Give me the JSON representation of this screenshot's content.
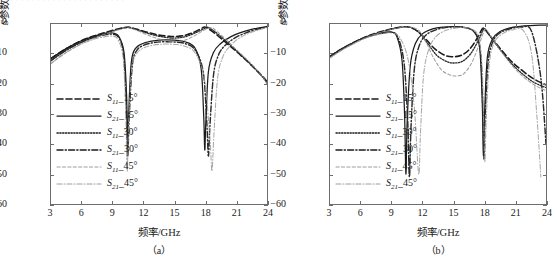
{
  "figure": {
    "scan_artifact_top": "· · ·   · · · · · ·        · ·  ·  · · · · · · ·  · · · ·  ·"
  },
  "panels": [
    {
      "id": "a",
      "caption": "（a）",
      "xlabel": "频率/GHz",
      "ylabel_prefix": "S",
      "ylabel_suffix": "参数/dB",
      "xticks": [
        "3",
        "6",
        "9",
        "12",
        "15",
        "18",
        "21",
        "24"
      ],
      "yticks": [
        "0",
        "−10",
        "−20",
        "−30",
        "−40",
        "−50",
        "−60"
      ],
      "legend": [
        {
          "sym": "S",
          "sub": "11",
          "ang": "_15°",
          "style": "dashed"
        },
        {
          "sym": "S",
          "sub": "21",
          "ang": "_15°",
          "style": "solid"
        },
        {
          "sym": "S",
          "sub": "11",
          "ang": "_30°",
          "style": "dotted"
        },
        {
          "sym": "S",
          "sub": "21",
          "ang": "_30°",
          "style": "dashdot"
        },
        {
          "sym": "S",
          "sub": "11",
          "ang": "_45°",
          "style": "dashed-light"
        },
        {
          "sym": "S",
          "sub": "21",
          "ang": "_45°",
          "style": "dashdot-light"
        }
      ]
    },
    {
      "id": "b",
      "caption": "（b）",
      "xlabel": "频率/GHz",
      "ylabel_prefix": "S",
      "ylabel_suffix": "参数/dB",
      "xticks": [
        "3",
        "6",
        "9",
        "12",
        "15",
        "18",
        "21",
        "24"
      ],
      "yticks": [
        "0",
        "−10",
        "−20",
        "−30",
        "−40",
        "−50",
        "−60"
      ],
      "legend": [
        {
          "sym": "S",
          "sub": "11",
          "ang": "_15°",
          "style": "dashed"
        },
        {
          "sym": "S",
          "sub": "21",
          "ang": "_15°",
          "style": "solid"
        },
        {
          "sym": "S",
          "sub": "11",
          "ang": "_30°",
          "style": "dotted"
        },
        {
          "sym": "S",
          "sub": "21",
          "ang": "_30°",
          "style": "dashdot"
        },
        {
          "sym": "S",
          "sub": "11",
          "ang": "_45°",
          "style": "dashed-light"
        },
        {
          "sym": "S",
          "sub": "21",
          "ang": "_45°",
          "style": "dashdot-light"
        }
      ]
    }
  ],
  "chart_data": [
    {
      "type": "line",
      "panel": "a",
      "title": "",
      "xlabel": "频率/GHz",
      "ylabel": "S参数/dB",
      "xlim": [
        3,
        24
      ],
      "ylim": [
        -60,
        0
      ],
      "xticks": [
        3,
        6,
        9,
        12,
        15,
        18,
        21,
        24
      ],
      "yticks": [
        0,
        -10,
        -20,
        -30,
        -40,
        -50,
        -60
      ],
      "grid": false,
      "legend_position": "left-lower",
      "series": [
        {
          "name": "S11_15°",
          "style": "dashed",
          "color": "#1a1a1a",
          "x": [
            3,
            4,
            5,
            6,
            7,
            8,
            9,
            9.6,
            10.1,
            10.4,
            10.5,
            10.6,
            11,
            11.6,
            12.5,
            13.5,
            14.5,
            15,
            16,
            17,
            17.5,
            17.85,
            17.95,
            18.1,
            18.5,
            19,
            19.6,
            20.5,
            21.5,
            22.5,
            23.5,
            24
          ],
          "y": [
            -11.5,
            -9.2,
            -7.2,
            -5.5,
            -4.2,
            -3.1,
            -2.1,
            -1.6,
            -1.2,
            -1.1,
            -1.05,
            -1.1,
            -1.4,
            -2.0,
            -2.9,
            -3.7,
            -4.1,
            -4.2,
            -3.8,
            -2.6,
            -1.7,
            -1.1,
            -1.0,
            -1.2,
            -2.0,
            -3.3,
            -5.0,
            -7.6,
            -10.6,
            -13.8,
            -17.2,
            -19.2
          ]
        },
        {
          "name": "S21_15°",
          "style": "solid",
          "color": "#1a1a1a",
          "x": [
            3,
            4,
            5,
            6,
            7,
            8,
            9,
            9.6,
            10.1,
            10.35,
            10.45,
            10.55,
            10.8,
            11.2,
            12,
            13,
            14,
            15,
            16,
            17,
            17.6,
            17.85,
            17.95,
            18.05,
            18.3,
            18.8,
            19.5,
            20.5,
            21.5,
            22.5,
            23.5,
            24
          ],
          "y": [
            -11.5,
            -9.2,
            -7.2,
            -5.5,
            -4.3,
            -3.4,
            -3.0,
            -4.2,
            -9.5,
            -24,
            -41,
            -30,
            -13,
            -8.2,
            -6.4,
            -5.6,
            -5.3,
            -5.4,
            -5.9,
            -8.0,
            -15,
            -31,
            -42,
            -33,
            -16,
            -9.5,
            -6.5,
            -4.2,
            -2.8,
            -1.8,
            -1.1,
            -0.8
          ]
        },
        {
          "name": "S11_30°",
          "style": "dotted",
          "color": "#2a2a2a",
          "x": [
            3,
            4,
            5,
            6,
            7,
            8,
            9,
            9.6,
            10.1,
            10.4,
            10.5,
            10.6,
            11,
            11.6,
            12.5,
            13.5,
            14.5,
            15,
            16,
            17,
            17.8,
            18.1,
            18.25,
            18.4,
            18.8,
            19.3,
            19.9,
            20.8,
            21.8,
            22.8,
            23.6,
            24
          ],
          "y": [
            -12.2,
            -9.8,
            -7.7,
            -6.0,
            -4.6,
            -3.4,
            -2.3,
            -1.7,
            -1.3,
            -1.15,
            -1.1,
            -1.15,
            -1.5,
            -2.2,
            -3.2,
            -4.1,
            -4.6,
            -4.7,
            -4.3,
            -3.0,
            -1.7,
            -1.2,
            -1.1,
            -1.3,
            -2.2,
            -3.6,
            -5.4,
            -8.2,
            -11.4,
            -14.8,
            -17.8,
            -19.7
          ]
        },
        {
          "name": "S21_30°",
          "style": "dashdot",
          "color": "#2a2a2a",
          "x": [
            3,
            4,
            5,
            6,
            7,
            8,
            9,
            9.6,
            10.05,
            10.3,
            10.45,
            10.6,
            10.9,
            11.3,
            12,
            13,
            14,
            15,
            16,
            17,
            17.8,
            18.15,
            18.3,
            18.45,
            18.8,
            19.3,
            20,
            21,
            22,
            23,
            23.6,
            24
          ],
          "y": [
            -12.2,
            -9.8,
            -7.7,
            -6.0,
            -4.7,
            -3.8,
            -3.4,
            -4.6,
            -10,
            -25,
            -44,
            -31,
            -14,
            -9.0,
            -7.1,
            -6.2,
            -5.9,
            -6.0,
            -6.5,
            -8.6,
            -16,
            -33,
            -44,
            -34,
            -17,
            -10.2,
            -6.9,
            -4.4,
            -2.9,
            -1.8,
            -1.3,
            -1.0
          ]
        },
        {
          "name": "S11_45°",
          "style": "dashed-light",
          "color": "#8e8e8e",
          "x": [
            3,
            4,
            5,
            6,
            7,
            8,
            9,
            9.6,
            10.1,
            10.4,
            10.5,
            10.6,
            11,
            11.6,
            12.5,
            13.5,
            14.5,
            15,
            16,
            17,
            17.9,
            18.4,
            18.6,
            18.75,
            19.1,
            19.6,
            20.2,
            21.1,
            22.1,
            23.1,
            23.8,
            24
          ],
          "y": [
            -13.2,
            -10.6,
            -8.4,
            -6.5,
            -5.0,
            -3.7,
            -2.5,
            -1.9,
            -1.45,
            -1.3,
            -1.25,
            -1.3,
            -1.7,
            -2.5,
            -3.8,
            -5.0,
            -5.7,
            -5.9,
            -5.4,
            -3.8,
            -2.0,
            -1.3,
            -1.2,
            -1.4,
            -2.4,
            -3.9,
            -5.8,
            -8.8,
            -12.0,
            -15.6,
            -18.6,
            -20.2
          ]
        },
        {
          "name": "S21_45°",
          "style": "dashdot-light",
          "color": "#9a9a9a",
          "x": [
            3,
            4,
            5,
            6,
            7,
            8,
            9,
            9.5,
            10,
            10.25,
            10.4,
            10.55,
            10.85,
            11.3,
            12,
            13,
            14,
            15,
            16,
            17,
            17.9,
            18.45,
            18.65,
            18.85,
            19.2,
            19.7,
            20.4,
            21.3,
            22.3,
            23.3,
            23.8,
            24
          ],
          "y": [
            -13.2,
            -10.6,
            -8.4,
            -6.6,
            -5.3,
            -4.4,
            -4.0,
            -5.2,
            -11,
            -27,
            -49,
            -33,
            -15,
            -10.0,
            -8.0,
            -7.0,
            -6.7,
            -6.8,
            -7.4,
            -9.6,
            -18,
            -38,
            -49,
            -36,
            -18,
            -11.0,
            -7.4,
            -4.7,
            -3.0,
            -1.9,
            -1.4,
            -1.2
          ]
        }
      ]
    },
    {
      "type": "line",
      "panel": "b",
      "title": "",
      "xlabel": "频率/GHz",
      "ylabel": "S参数/dB",
      "xlim": [
        3,
        24
      ],
      "ylim": [
        -60,
        0
      ],
      "xticks": [
        3,
        6,
        9,
        12,
        15,
        18,
        21,
        24
      ],
      "yticks": [
        0,
        -10,
        -20,
        -30,
        -40,
        -50,
        -60
      ],
      "grid": false,
      "legend_position": "left-lower",
      "series": [
        {
          "name": "S11_15°",
          "style": "dashed",
          "color": "#1a1a1a",
          "x": [
            3,
            4,
            5,
            6,
            7,
            8,
            9,
            9.6,
            10.05,
            10.3,
            10.42,
            10.55,
            10.9,
            11.5,
            12.3,
            13.2,
            14.2,
            15,
            15.8,
            16.6,
            17.3,
            17.75,
            17.88,
            18.02,
            18.3,
            18.8,
            19.5,
            20.5,
            21.5,
            22.5,
            23.3,
            24
          ],
          "y": [
            -10.8,
            -8.6,
            -6.7,
            -5.0,
            -3.6,
            -2.5,
            -1.6,
            -1.2,
            -0.95,
            -0.9,
            -0.9,
            -0.95,
            -1.3,
            -2.4,
            -5.0,
            -8.3,
            -10.5,
            -10.9,
            -10.4,
            -8.3,
            -4.8,
            -1.9,
            -1.4,
            -1.6,
            -2.8,
            -5.0,
            -8.0,
            -12.0,
            -15.0,
            -17.6,
            -19.2,
            -20.3
          ]
        },
        {
          "name": "S21_15°",
          "style": "solid",
          "color": "#1a1a1a",
          "x": [
            3,
            4,
            5,
            6,
            7,
            8,
            9,
            9.5,
            10,
            10.25,
            10.38,
            10.5,
            10.8,
            11.3,
            12,
            13,
            14,
            15,
            16,
            17,
            17.55,
            17.8,
            17.92,
            18.05,
            18.3,
            18.8,
            19.5,
            20.5,
            21.5,
            22.5,
            23.5,
            24
          ],
          "y": [
            -10.8,
            -8.6,
            -6.7,
            -5.0,
            -3.8,
            -3.0,
            -2.7,
            -4.2,
            -12,
            -30,
            -50,
            -33,
            -14,
            -6.5,
            -3.2,
            -1.6,
            -1.0,
            -0.85,
            -1.1,
            -2.6,
            -8.0,
            -26,
            -44,
            -28,
            -11,
            -5.0,
            -2.6,
            -1.3,
            -0.8,
            -0.55,
            -0.4,
            -0.35
          ]
        },
        {
          "name": "S11_30°",
          "style": "dotted",
          "color": "#2a2a2a",
          "x": [
            3,
            4,
            5,
            6,
            7,
            8,
            9,
            9.6,
            10.1,
            10.4,
            10.55,
            10.7,
            11.1,
            11.7,
            12.5,
            13.4,
            14.4,
            15.1,
            15.9,
            16.7,
            17.4,
            17.85,
            17.98,
            18.12,
            18.4,
            18.9,
            19.6,
            20.6,
            21.6,
            22.6,
            23.4,
            24
          ],
          "y": [
            -10.9,
            -8.7,
            -6.8,
            -5.1,
            -3.7,
            -2.6,
            -1.7,
            -1.25,
            -1.0,
            -0.95,
            -0.95,
            -1.0,
            -1.5,
            -3.0,
            -6.5,
            -10.5,
            -12.6,
            -13.0,
            -12.4,
            -9.8,
            -5.6,
            -2.2,
            -1.6,
            -1.8,
            -3.2,
            -5.6,
            -8.8,
            -13.0,
            -16.3,
            -19.0,
            -20.4,
            -21.2
          ]
        },
        {
          "name": "S21_30°",
          "style": "dashdot",
          "color": "#2a2a2a",
          "x": [
            3,
            4,
            5,
            6,
            7,
            8,
            9,
            9.6,
            10.2,
            10.55,
            10.72,
            10.88,
            11.2,
            11.7,
            12.4,
            13.4,
            14.4,
            15.2,
            16.2,
            17.1,
            17.62,
            17.85,
            17.97,
            18.1,
            18.4,
            18.9,
            19.6,
            20.6,
            21.6,
            22.6,
            23.5,
            24
          ],
          "y": [
            -10.9,
            -8.7,
            -6.8,
            -5.1,
            -3.9,
            -3.1,
            -2.8,
            -4.4,
            -13,
            -32,
            -51,
            -34,
            -15,
            -7.0,
            -3.5,
            -1.8,
            -1.1,
            -0.95,
            -1.2,
            -2.9,
            -9.0,
            -27,
            -45,
            -29,
            -12,
            -5.4,
            -2.8,
            -1.5,
            -1.0,
            -2.5,
            -18,
            -40
          ]
        },
        {
          "name": "S11_45°",
          "style": "dashed-light",
          "color": "#8e8e8e",
          "x": [
            3,
            4,
            5,
            6,
            7,
            8,
            9,
            9.7,
            10.3,
            10.7,
            10.95,
            11.2,
            11.7,
            12.3,
            13.1,
            13.9,
            14.7,
            15.3,
            16,
            16.8,
            17.5,
            17.95,
            18.1,
            18.25,
            18.6,
            19.1,
            19.8,
            20.8,
            21.8,
            22.8,
            23.5,
            24
          ],
          "y": [
            -11.3,
            -9.0,
            -7.1,
            -5.3,
            -3.9,
            -2.7,
            -1.8,
            -1.3,
            -1.05,
            -1.0,
            -1.05,
            -1.3,
            -2.4,
            -5.8,
            -11.5,
            -15.5,
            -17.0,
            -17.3,
            -16.6,
            -12.8,
            -6.8,
            -2.6,
            -1.9,
            -2.1,
            -3.8,
            -6.4,
            -9.8,
            -14.2,
            -17.6,
            -20.2,
            -21.5,
            -22.2
          ]
        },
        {
          "name": "S21_45°",
          "style": "dashdot-light",
          "color": "#9a9a9a",
          "x": [
            3,
            4,
            5,
            6,
            7,
            8,
            9,
            9.8,
            10.6,
            11.2,
            11.62,
            11.8,
            12.1,
            12.6,
            13.3,
            14.2,
            15.1,
            15.9,
            16.7,
            17.4,
            17.78,
            17.95,
            18.06,
            18.2,
            18.5,
            19,
            19.8,
            20.8,
            21.8,
            22.6,
            23.1,
            23.5
          ],
          "y": [
            -11.3,
            -9.0,
            -7.1,
            -5.4,
            -4.1,
            -3.3,
            -3.0,
            -4.6,
            -12,
            -28,
            -50,
            -36,
            -17,
            -8.5,
            -4.2,
            -2.2,
            -1.4,
            -1.2,
            -1.6,
            -4.0,
            -14,
            -33,
            -46,
            -31,
            -13,
            -6.0,
            -3.2,
            -1.9,
            -2.2,
            -10,
            -30,
            -51
          ]
        }
      ]
    }
  ]
}
